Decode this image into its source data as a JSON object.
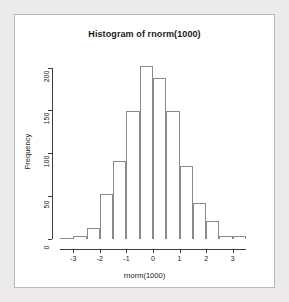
{
  "window": {
    "background_color": "#eceaea",
    "panel_color": "#ffffff",
    "border_color": "#b9b9b9"
  },
  "chart_data": {
    "type": "bar",
    "title": "Histogram of rnorm(1000)",
    "xlabel": "rnorm(1000)",
    "ylabel": "Frequency",
    "grid": false,
    "legend": null,
    "axis_color": "#3d3d3d",
    "bar_border_color": "#8a8a8a",
    "bar_fill_color": "transparent",
    "bin_width": 0.5,
    "xlim": [
      -3.5,
      3.5
    ],
    "ylim": [
      0,
      210
    ],
    "xticks": [
      -3,
      -2,
      -1,
      0,
      1,
      2,
      3
    ],
    "xtick_labels": [
      "-3",
      "-2",
      "-1",
      "0",
      "1",
      "2",
      "3"
    ],
    "yticks": [
      0,
      50,
      100,
      150,
      200
    ],
    "ytick_labels": [
      "0",
      "50",
      "100",
      "150",
      "200"
    ],
    "bin_edges": [
      -3.5,
      -3.0,
      -2.5,
      -2.0,
      -1.5,
      -1.0,
      -0.5,
      0.0,
      0.5,
      1.0,
      1.5,
      2.0,
      2.5,
      3.0,
      3.5
    ],
    "categories": [
      "-3.5..-3.0",
      "-3.0..-2.5",
      "-2.5..-2.0",
      "-2.0..-1.5",
      "-1.5..-1.0",
      "-1.0..-0.5",
      "-0.5..0.0",
      "0.0..0.5",
      "0.5..1.0",
      "1.0..1.5",
      "1.5..2.0",
      "2.0..2.5",
      "2.5..3.0",
      "3.0..3.5"
    ],
    "values": [
      1,
      4,
      13,
      52,
      91,
      149,
      202,
      188,
      149,
      85,
      42,
      21,
      4,
      3
    ]
  }
}
